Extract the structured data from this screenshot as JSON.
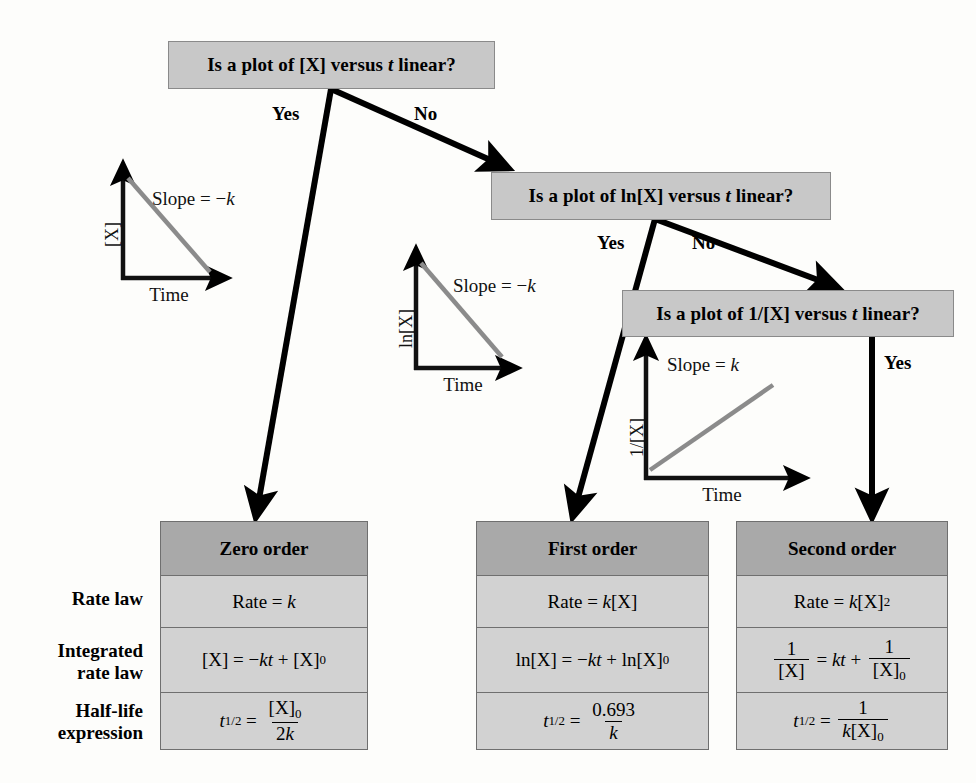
{
  "questions": [
    {
      "id": "q1",
      "pre": "Is a plot of [X] versus ",
      "var": "t",
      "post": " linear?"
    },
    {
      "id": "q2",
      "pre": "Is a plot of  ln[X] versus ",
      "var": "t",
      "post": " linear?"
    },
    {
      "id": "q3",
      "pre": "Is a plot of  1/[X] versus ",
      "var": "t",
      "post": " linear?"
    }
  ],
  "branch_labels": {
    "q1_yes": "Yes",
    "q1_no": "No",
    "q2_yes": "Yes",
    "q2_no": "No",
    "q3_yes": "Yes"
  },
  "plots": [
    {
      "id": "plot-zero-order",
      "ylabel": "[X]",
      "xlabel": "Time",
      "slope_text": "Slope = −k",
      "slope_prefix": "Slope = −",
      "slope_var": "k",
      "trend": "decreasing"
    },
    {
      "id": "plot-first-order",
      "ylabel": "ln[X]",
      "xlabel": "Time",
      "slope_text": "Slope = −k",
      "slope_prefix": "Slope = −",
      "slope_var": "k",
      "trend": "decreasing"
    },
    {
      "id": "plot-second-order",
      "ylabel": "1/[X]",
      "xlabel": "Time",
      "slope_text": "Slope = k",
      "slope_prefix": "Slope = ",
      "slope_var": "k",
      "trend": "increasing"
    }
  ],
  "row_labels": [
    {
      "line1": "Rate law",
      "line2": ""
    },
    {
      "line1": "Integrated",
      "line2": "rate law"
    },
    {
      "line1": "Half-life",
      "line2": "expression"
    }
  ],
  "results": [
    {
      "id": "zero-order",
      "header": "Zero order",
      "rate_law": "Rate = k",
      "integrated_rate_law": "[X] = −kt + [X]0",
      "half_life": "t1/2 = [X]0 / 2k"
    },
    {
      "id": "first-order",
      "header": "First order",
      "rate_law": "Rate = k[X]",
      "integrated_rate_law": "ln[X] = −kt + ln[X]0",
      "half_life": "t1/2 = 0.693 / k"
    },
    {
      "id": "second-order",
      "header": "Second order",
      "rate_law": "Rate = k[X]²",
      "integrated_rate_law": "1/[X] = kt + 1/[X]0",
      "half_life": "t1/2 = 1 / k[X]0"
    }
  ],
  "colors": {
    "question_box_fill": "#c8c8c8",
    "question_box_border": "#8a8a8a",
    "table_header_fill": "#a9a9a9",
    "table_cell_fill": "#d2d2d2",
    "table_border": "#6f6f6f",
    "plot_line": "#8b8b8b",
    "axis": "#111111",
    "arrow": "#000000",
    "page_background": "#fdfdfb"
  }
}
